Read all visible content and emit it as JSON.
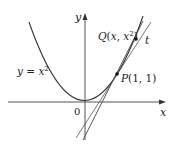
{
  "diagram": {
    "curve_label": "y = x²",
    "curve_label_parts": {
      "y": "y",
      "eq": " = ",
      "x": "x",
      "exp": "2"
    },
    "axis_x_label": "x",
    "axis_y_label": "y",
    "origin_label": "0",
    "point_p": {
      "name": "P",
      "coords": "(1, 1)"
    },
    "point_q": {
      "name": "Q",
      "open": "(",
      "x": "x",
      "comma": ", ",
      "x2": "x",
      "exp": "2",
      "close": ")"
    },
    "tangent_label": "t",
    "colors": {
      "line": "#333333",
      "background": "#ffffff"
    }
  }
}
